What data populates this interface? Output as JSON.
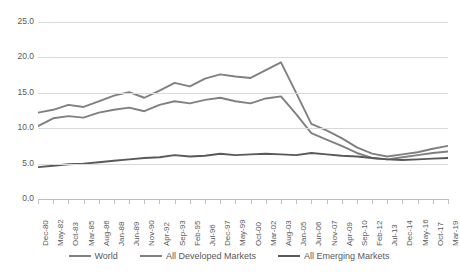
{
  "chart_data": {
    "type": "line",
    "title": "",
    "xlabel": "",
    "ylabel": "",
    "ylim": [
      0,
      25
    ],
    "ytick_step": 5,
    "grid": true,
    "legend_position": "bottom",
    "yticks": [
      "0.0",
      "5.0",
      "10.0",
      "15.0",
      "20.0",
      "25.0"
    ],
    "categories": [
      "Dec-80",
      "May-82",
      "Oct-83",
      "Mar-85",
      "Aug-86",
      "Jan-88",
      "Jun-89",
      "Nov-90",
      "Apr-92",
      "Sep-93",
      "Feb-95",
      "Jul-96",
      "Dec-97",
      "May-99",
      "Oct-00",
      "Mar-02",
      "Aug-03",
      "Jan-05",
      "Jun-06",
      "Nov-07",
      "Apr-09",
      "Sep-10",
      "Feb-12",
      "Jul-13",
      "Dec-14",
      "May-16",
      "Oct-17",
      "Mar-19"
    ],
    "series": [
      {
        "name": "World",
        "color": "#808080",
        "values": [
          12.2,
          12.6,
          13.3,
          13.0,
          13.8,
          14.6,
          15.1,
          14.3,
          15.3,
          16.4,
          15.9,
          17.0,
          17.6,
          17.3,
          17.1,
          18.2,
          19.3,
          15.0,
          10.6,
          9.7,
          8.6,
          7.3,
          6.4,
          6.0,
          6.3,
          6.6,
          7.1,
          7.5
        ]
      },
      {
        "name": "All Developed Markets",
        "color": "#808080",
        "values": [
          10.3,
          11.4,
          11.7,
          11.5,
          12.2,
          12.6,
          12.9,
          12.4,
          13.3,
          13.8,
          13.5,
          14.0,
          14.3,
          13.8,
          13.5,
          14.2,
          14.5,
          12.0,
          9.3,
          8.4,
          7.5,
          6.5,
          5.8,
          5.6,
          5.9,
          6.2,
          6.5,
          6.7
        ]
      },
      {
        "name": "All Emerging Markets",
        "color": "#595959",
        "values": [
          4.5,
          4.7,
          4.9,
          5.0,
          5.2,
          5.4,
          5.6,
          5.8,
          5.9,
          6.2,
          6.0,
          6.1,
          6.4,
          6.2,
          6.3,
          6.4,
          6.3,
          6.2,
          6.5,
          6.3,
          6.1,
          6.0,
          5.8,
          5.6,
          5.5,
          5.6,
          5.7,
          5.8
        ]
      }
    ]
  },
  "legend": {
    "items": [
      {
        "label": "World"
      },
      {
        "label": "All Developed Markets"
      },
      {
        "label": "All Emerging Markets"
      }
    ]
  }
}
